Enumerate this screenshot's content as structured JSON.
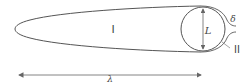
{
  "diagram": {
    "labels": {
      "region_inside": "I",
      "region_outside": "II",
      "diameter": "L",
      "film_thickness": "δ",
      "length": "λ"
    },
    "colors": {
      "stroke": "#555555",
      "arrow": "#666666",
      "text": "#444444",
      "background": "#ffffff"
    }
  }
}
